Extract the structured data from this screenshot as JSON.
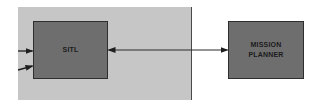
{
  "diagram": {
    "panel": {
      "fill": "#c6c6c6"
    },
    "nodes": {
      "sitl": {
        "label": "SITL",
        "fill": "#6e6e6e"
      },
      "mission_planner": {
        "label": "MISSION\nPLANNER",
        "fill": "#6e6e6e"
      }
    },
    "edges": [
      {
        "from": "external-input-1",
        "to": "sitl",
        "type": "arrow"
      },
      {
        "from": "external-input-2",
        "to": "sitl",
        "type": "arrow"
      },
      {
        "from": "sitl",
        "to": "mission_planner",
        "type": "bidirectional-arrow"
      }
    ],
    "colors": {
      "background": "#ffffff",
      "line": "#2a2a2a"
    }
  }
}
